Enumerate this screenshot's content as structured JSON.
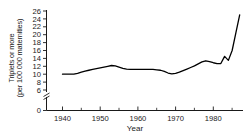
{
  "chart_data": {
    "type": "line",
    "title": "",
    "xlabel": "Year",
    "ylabel": "Triplets or more (per 100 000 maternities)",
    "ylabel_line1": "Triplets or more",
    "ylabel_line2": "(per 100 000 maternities)",
    "xlim": [
      1936,
      1988
    ],
    "ylim": [
      0,
      26
    ],
    "y_axis_break": true,
    "y_break_between": [
      0,
      6
    ],
    "grid": false,
    "legend": null,
    "xticks": [
      1940,
      1950,
      1960,
      1970,
      1980
    ],
    "xtick_labels": [
      "1940",
      "1950",
      "1960",
      "1970",
      "1980"
    ],
    "xminor_ticks": [
      1945,
      1955,
      1965,
      1975,
      1985
    ],
    "yticks": [
      0,
      6,
      8,
      10,
      12,
      14,
      16,
      18,
      20,
      22,
      24,
      26
    ],
    "ytick_labels": [
      "0",
      "6",
      "8",
      "10",
      "12",
      "14",
      "16",
      "18",
      "20",
      "22",
      "24",
      "26"
    ],
    "line_color": "#000000",
    "line_width": 1.3,
    "x": [
      1940,
      1941,
      1942,
      1943,
      1944,
      1945,
      1946,
      1947,
      1948,
      1949,
      1950,
      1951,
      1952,
      1953,
      1954,
      1955,
      1956,
      1957,
      1958,
      1959,
      1960,
      1961,
      1962,
      1963,
      1964,
      1965,
      1966,
      1967,
      1968,
      1969,
      1970,
      1971,
      1972,
      1973,
      1974,
      1975,
      1976,
      1977,
      1978,
      1979,
      1980,
      1981,
      1982,
      1983,
      1984,
      1985,
      1986,
      1987
    ],
    "values": [
      10.0,
      10.0,
      10.0,
      10.0,
      10.2,
      10.5,
      10.8,
      11.0,
      11.2,
      11.4,
      11.6,
      11.8,
      12.0,
      12.2,
      12.1,
      11.8,
      11.5,
      11.3,
      11.2,
      11.2,
      11.2,
      11.2,
      11.2,
      11.2,
      11.2,
      11.1,
      11.0,
      10.7,
      10.3,
      10.1,
      10.2,
      10.5,
      10.9,
      11.3,
      11.7,
      12.1,
      12.6,
      13.1,
      13.4,
      13.2,
      12.9,
      12.7,
      12.7,
      14.5,
      13.5,
      16.0,
      20.5,
      25.0
    ],
    "series_name": "Triplet and higher-order maternity rate"
  }
}
